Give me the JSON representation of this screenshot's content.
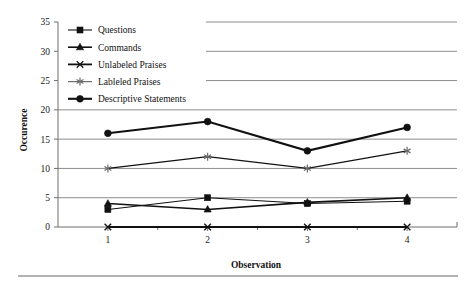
{
  "figure": {
    "background": "#ffffff",
    "ink_color": "#111111",
    "grid_color": "#8d8d8d",
    "page_rule_color": "#9a9a9a"
  },
  "chart_data": {
    "type": "line",
    "title": "",
    "xlabel": "Observation",
    "ylabel": "Occurence",
    "categories": [
      "1",
      "2",
      "3",
      "4"
    ],
    "x": [
      1,
      2,
      3,
      4
    ],
    "xlim": [
      0.5,
      4.5
    ],
    "ylim": [
      0,
      35
    ],
    "ytick_labels": [
      "0",
      "5",
      "10",
      "15",
      "20",
      "25",
      "30",
      "35"
    ],
    "ytick_values": [
      0,
      5,
      10,
      15,
      20,
      25,
      30,
      35
    ],
    "xtick_labels": [
      "1",
      "2",
      "3",
      "4"
    ],
    "grid": "horizontal",
    "legend_position": "upper-left-inside",
    "series": [
      {
        "name": "Questions",
        "marker": "square",
        "color": "#111111",
        "line_width": 1.1,
        "values": [
          3,
          5,
          4,
          4.4
        ]
      },
      {
        "name": "Commands",
        "marker": "triangle",
        "color": "#111111",
        "line_width": 1.6,
        "values": [
          4,
          3,
          4.2,
          5
        ]
      },
      {
        "name": "Unlabeled Praises",
        "marker": "x",
        "color": "#111111",
        "line_width": 1.8,
        "values": [
          0,
          0,
          0,
          0
        ]
      },
      {
        "name": "Lableled Praises",
        "marker": "star",
        "color": "#6b6b6b",
        "line_width": 1.2,
        "values": [
          10,
          12,
          10,
          13
        ]
      },
      {
        "name": "Descriptive Statements",
        "marker": "circle",
        "color": "#111111",
        "line_width": 2.1,
        "values": [
          16,
          18,
          13,
          17
        ]
      }
    ]
  }
}
